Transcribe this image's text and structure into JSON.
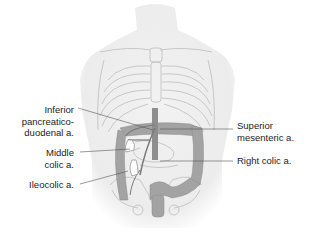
{
  "figure": {
    "labels": {
      "inferior_pancreaticoduodenal": "Inferior\npancreatico-\nduodenal a.",
      "middle_colic": "Middle\ncolic a.",
      "ileocolic": "Ileocolic a.",
      "superior_mesenteric": "Superior\nmesenteric a.",
      "right_colic": "Right colic a."
    },
    "colors": {
      "body_shade": "#ececec",
      "bone_line": "#b8b8b8",
      "colon": "#9a9a9a",
      "artery": "#7a7a7a",
      "leader_line": "#555555"
    }
  }
}
